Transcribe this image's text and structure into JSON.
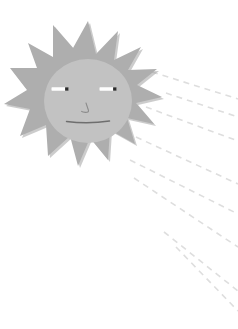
{
  "canvas": {
    "width": 238,
    "height": 329,
    "background_color": "#ffffff",
    "title": "Sun with face and dashed rays"
  },
  "palette": {
    "background": "#ffffff",
    "sun_spikes": "#aeaeae",
    "sun_spikes_shadow": "#9d9d9d",
    "sun_face": "#c2c2c2",
    "sun_face_edge": "#b8b8b8",
    "eye_white": "#fefefe",
    "pupil": "#2b2b2b",
    "mouth": "#6e6e6e",
    "nose": "#8c8c8c",
    "ray_dash": "#dedede"
  },
  "sun": {
    "label": "sun",
    "center_x": 88,
    "center_y": 101,
    "face_radius_x": 44,
    "face_radius_y": 42,
    "spike_count": 16,
    "spike_outer_radius": 68,
    "face_color": "#c2c2c2",
    "spike_color": "#aeaeae",
    "face": {
      "label": "sun-face",
      "eyes": [
        {
          "label": "left-eye",
          "cx": 60,
          "cy": 89,
          "width": 17,
          "height": 3.4,
          "pupil_side": "right",
          "pupil_size": 3.4
        },
        {
          "label": "right-eye",
          "cx": 108,
          "cy": 89,
          "width": 17,
          "height": 3.4,
          "pupil_side": "right",
          "pupil_size": 3.4
        }
      ],
      "nose": {
        "label": "nose",
        "x": 86,
        "y": 104,
        "length": 10
      },
      "mouth": {
        "label": "mouth",
        "x": 66,
        "y": 122,
        "width": 42,
        "curve": "flat"
      }
    }
  },
  "rays": {
    "label": "dashed-sun-rays",
    "color": "#dedede",
    "stroke_width": 1.6,
    "dash_pattern": "6 5",
    "count": 8,
    "lines": [
      {
        "label": "ray-1",
        "x1": 152,
        "y1": 72,
        "x2": 238,
        "y2": 99
      },
      {
        "label": "ray-2",
        "x1": 166,
        "y1": 93,
        "x2": 238,
        "y2": 117
      },
      {
        "label": "ray-3",
        "x1": 146,
        "y1": 107,
        "x2": 238,
        "y2": 141
      },
      {
        "label": "ray-4",
        "x1": 136,
        "y1": 137,
        "x2": 238,
        "y2": 184
      },
      {
        "label": "ray-5",
        "x1": 130,
        "y1": 160,
        "x2": 238,
        "y2": 214
      },
      {
        "label": "ray-6",
        "x1": 134,
        "y1": 178,
        "x2": 238,
        "y2": 247
      },
      {
        "label": "ray-7",
        "x1": 164,
        "y1": 232,
        "x2": 238,
        "y2": 291
      },
      {
        "label": "ray-8",
        "x1": 176,
        "y1": 247,
        "x2": 238,
        "y2": 311
      }
    ]
  }
}
